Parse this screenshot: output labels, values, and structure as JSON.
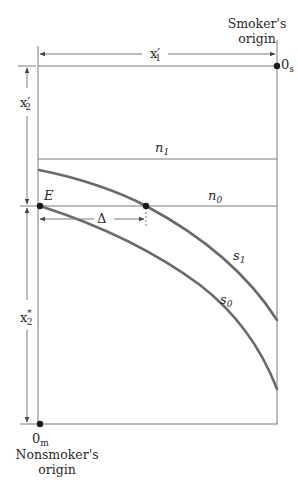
{
  "diagram": {
    "type": "edgeworth-box",
    "labels": {
      "smoker_origin_line1": "Smoker's",
      "smoker_origin_line2": "origin",
      "smoker_origin_symbol": "0",
      "smoker_origin_sub": "s",
      "nonsmoker_origin_symbol": "0",
      "nonsmoker_origin_sub": "m",
      "nonsmoker_origin_line1": "Nonsmoker's",
      "nonsmoker_origin_line2": "origin",
      "x1_prime": "x",
      "x1_prime_sub": "1",
      "x2_prime": "x",
      "x2_prime_sub": "2",
      "prime_mark": "′",
      "x2_star": "x",
      "x2_star_sub": "2",
      "star_mark": "*",
      "n1": "n",
      "n1_sub": "1",
      "n0": "n",
      "n0_sub": "0",
      "s1": "s",
      "s1_sub": "1",
      "s0": "s",
      "s0_sub": "0",
      "E": "E",
      "delta": "Δ"
    },
    "colors": {
      "line": "#7a7a7a",
      "curve": "#6a6a6a",
      "point": "#1a1a1a"
    }
  }
}
